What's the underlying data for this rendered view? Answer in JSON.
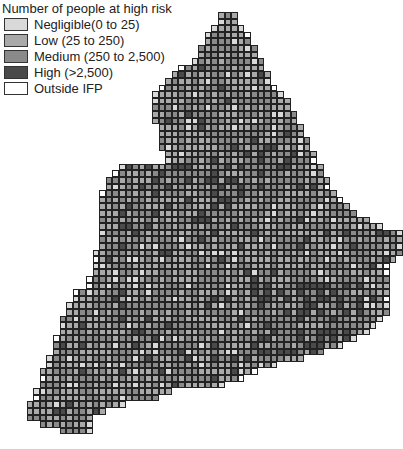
{
  "legend": {
    "title": "Number of people at high risk",
    "items": [
      {
        "label": "Negligible(0 to 25)",
        "color": "#d9d9d9"
      },
      {
        "label": "Low (25 to 250)",
        "color": "#a9a9a9"
      },
      {
        "label": "Medium (250 to 2,500)",
        "color": "#8a8a8a"
      },
      {
        "label": "High (>2,500)",
        "color": "#4a4a4a"
      },
      {
        "label": "Outside IFP",
        "color": "#ffffff"
      }
    ]
  },
  "map": {
    "region": "England and Wales grid",
    "cell_size": 6.6,
    "origin": [
      20,
      12
    ],
    "rows": [
      [
        30,
        32
      ],
      [
        30,
        32
      ],
      [
        29,
        33
      ],
      [
        28,
        34
      ],
      [
        28,
        34
      ],
      [
        27,
        35
      ],
      [
        27,
        35
      ],
      [
        26,
        36
      ],
      [
        24,
        36
      ],
      [
        23,
        37
      ],
      [
        22,
        37
      ],
      [
        21,
        38
      ],
      [
        20,
        39
      ],
      [
        20,
        40
      ],
      [
        20,
        40
      ],
      [
        20,
        41
      ],
      [
        20,
        41
      ],
      [
        21,
        42
      ],
      [
        21,
        42
      ],
      [
        21,
        43
      ],
      [
        21,
        43
      ],
      [
        22,
        44
      ],
      [
        22,
        44
      ],
      [
        15,
        45
      ],
      [
        14,
        45
      ],
      [
        13,
        46
      ],
      [
        13,
        46
      ],
      [
        12,
        47
      ],
      [
        12,
        48
      ],
      [
        12,
        49
      ],
      [
        12,
        50
      ],
      [
        12,
        52
      ],
      [
        12,
        54
      ],
      [
        12,
        57
      ],
      [
        12,
        57
      ],
      [
        12,
        57
      ],
      [
        11,
        57
      ],
      [
        11,
        56
      ],
      [
        11,
        55
      ],
      [
        11,
        55
      ],
      [
        10,
        55
      ],
      [
        10,
        55
      ],
      [
        8,
        55
      ],
      [
        8,
        55
      ],
      [
        7,
        55
      ],
      [
        7,
        55
      ],
      [
        6,
        54
      ],
      [
        6,
        53
      ],
      [
        6,
        52
      ],
      [
        5,
        50
      ],
      [
        5,
        48
      ],
      [
        5,
        45
      ],
      [
        4,
        42
      ],
      [
        4,
        38
      ],
      [
        3,
        35
      ],
      [
        3,
        33
      ],
      [
        3,
        30
      ],
      [
        2,
        22
      ],
      [
        2,
        20
      ],
      [
        1,
        15
      ],
      [
        1,
        12
      ],
      [
        1,
        10
      ],
      [
        3,
        10
      ],
      [
        6,
        10
      ]
    ]
  }
}
